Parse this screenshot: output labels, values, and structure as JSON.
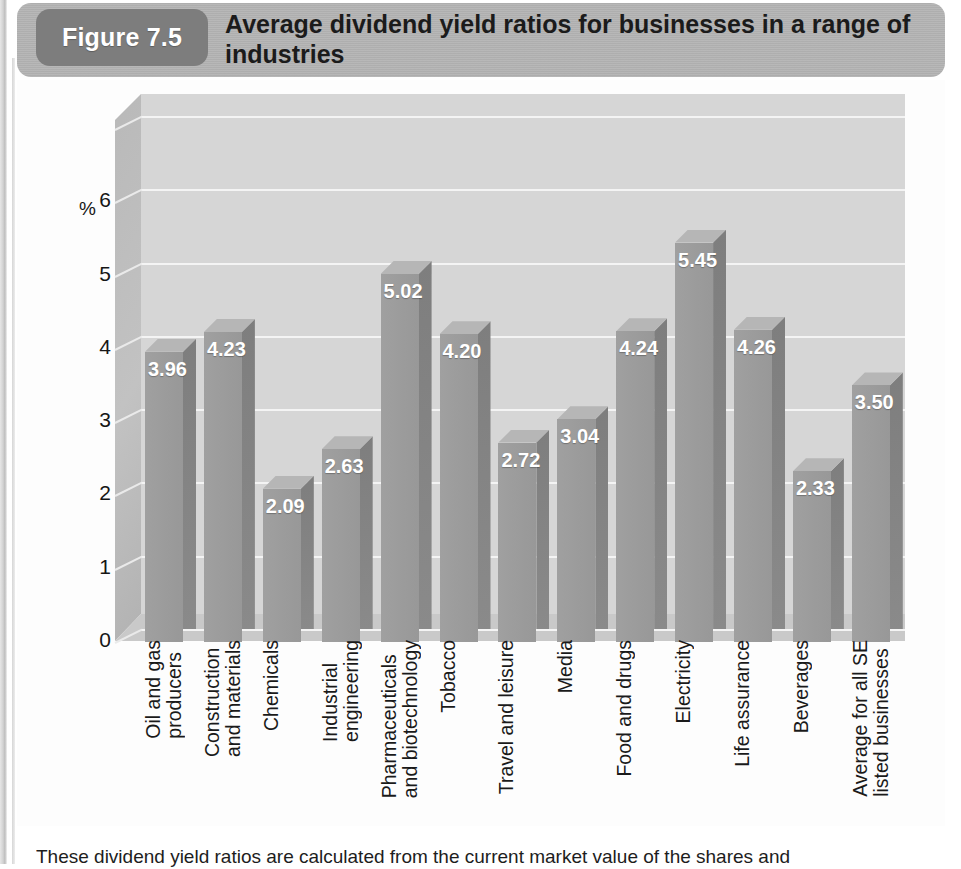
{
  "figure": {
    "badge_label": "Figure 7.5",
    "title": "Average dividend yield ratios for businesses in a range of industries",
    "badge_color": "#7d7d7d",
    "banner_color": "#b4b4b4"
  },
  "caption": {
    "text": "These dividend yield ratios are calculated from the current market value of the shares and"
  },
  "axis": {
    "y_unit_label": "%",
    "y_ticks": [
      "6",
      "5",
      "4",
      "3",
      "2",
      "1",
      "0"
    ]
  },
  "chart_data": {
    "type": "bar",
    "title": "Average dividend yield ratios for businesses in a range of industries",
    "xlabel": "",
    "ylabel": "%",
    "ylim": [
      0,
      7
    ],
    "ytick_values": [
      0,
      1,
      2,
      3,
      4,
      5,
      6
    ],
    "grid": true,
    "legend": "none",
    "value_label_format": "0.00",
    "bar_color": "#9b9b9b",
    "plot_background": "#d6d6d6",
    "categories": [
      "Oil and gas producers",
      "Construction and materials",
      "Chemicals",
      "Industrial engineering",
      "Pharmaceuticals and biotechnology",
      "Tobacco",
      "Travel and leisure",
      "Media",
      "Food and drugs",
      "Electricity",
      "Life assurance",
      "Beverages",
      "Average for all SE listed businesses"
    ],
    "category_lines": [
      "Oil and gas\nproducers",
      "Construction\nand materials",
      "Chemicals",
      "Industrial\nengineering",
      "Pharmaceuticals\nand biotechnology",
      "Tobacco",
      "Travel and leisure",
      "Media",
      "Food and drugs",
      "Electricity",
      "Life assurance",
      "Beverages",
      "Average for all SE\nlisted businesses"
    ],
    "values": [
      3.96,
      4.23,
      2.09,
      2.63,
      5.02,
      4.2,
      2.72,
      3.04,
      4.24,
      5.45,
      4.26,
      2.33,
      3.5
    ],
    "value_labels": [
      "3.96",
      "4.23",
      "2.09",
      "2.63",
      "5.02",
      "4.20",
      "2.72",
      "3.04",
      "4.24",
      "5.45",
      "4.26",
      "2.33",
      "3.50"
    ]
  }
}
